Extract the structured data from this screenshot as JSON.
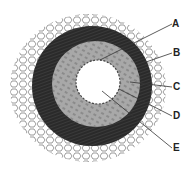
{
  "diagram": {
    "labels": [
      {
        "id": "A",
        "text": "A",
        "x": 172,
        "y": 19,
        "tx": 100,
        "ty": 60
      },
      {
        "id": "B",
        "text": "B",
        "x": 173,
        "y": 48,
        "tx": 146,
        "ty": 62
      },
      {
        "id": "C",
        "text": "C",
        "x": 173,
        "y": 82,
        "tx": 130,
        "ty": 82
      },
      {
        "id": "D",
        "text": "D",
        "x": 173,
        "y": 112,
        "tx": 119,
        "ty": 89
      },
      {
        "id": "E",
        "text": "E",
        "x": 173,
        "y": 144,
        "tx": 102,
        "ty": 91
      }
    ],
    "colors": {
      "outer_tissue": "#ffffff",
      "tunica_externa": "#3a3a3a",
      "tunica_media": "#a8a8a8",
      "intima": "#ffffff",
      "lumen": "#ffffff",
      "line": "#333333"
    }
  }
}
